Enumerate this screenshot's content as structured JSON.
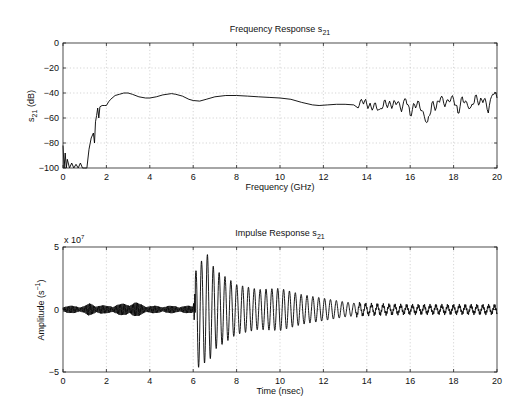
{
  "chart_data": [
    {
      "type": "line",
      "title": "Frequency Response s",
      "title_subscript": "21",
      "xlabel": "Frequency (GHz)",
      "ylabel": "s",
      "ylabel_subscript": "21",
      "ylabel_suffix": " (dB)",
      "xlim": [
        0,
        20
      ],
      "ylim": [
        -100,
        0
      ],
      "xticks": [
        0,
        2,
        4,
        6,
        8,
        10,
        12,
        14,
        16,
        18,
        20
      ],
      "xtick_labels": [
        "0",
        "2",
        "4",
        "6",
        "8",
        "10",
        "12",
        "14",
        "16",
        "18",
        "20"
      ],
      "yticks": [
        0,
        -20,
        -40,
        -60,
        -80,
        -100
      ],
      "ytick_labels": [
        "0",
        "−20",
        "−40",
        "−60",
        "−80",
        "−100"
      ],
      "grid": true,
      "series": [
        {
          "name": "s21 magnitude",
          "x": [
            0,
            0.05,
            0.1,
            0.15,
            0.2,
            0.3,
            0.4,
            0.5,
            0.6,
            0.7,
            0.8,
            0.9,
            1.0,
            1.1,
            1.15,
            1.2,
            1.3,
            1.4,
            1.45,
            1.5,
            1.55,
            1.6,
            1.65,
            1.7,
            1.8,
            1.9,
            2.0,
            2.1,
            2.2,
            2.4,
            2.6,
            2.8,
            3.0,
            3.2,
            3.5,
            3.8,
            4.0,
            4.3,
            4.6,
            5.0,
            5.2,
            5.5,
            5.8,
            6.0,
            6.3,
            6.6,
            7.0,
            7.5,
            8.0,
            8.5,
            9.0,
            9.5,
            10.0,
            10.5,
            11.0,
            11.5,
            11.8,
            12.2,
            12.6,
            13.0,
            13.4,
            13.6,
            13.8,
            14.0,
            14.2,
            14.4,
            14.6,
            14.8,
            15.0,
            15.2,
            15.4,
            15.6,
            15.8,
            16.0,
            16.2,
            16.4,
            16.6,
            16.8,
            17.0,
            17.2,
            17.4,
            17.6,
            17.8,
            18.0,
            18.2,
            18.4,
            18.6,
            18.8,
            19.0,
            19.2,
            19.4,
            19.6,
            19.8,
            20.0
          ],
          "y": [
            -82,
            -100,
            -88,
            -100,
            -93,
            -100,
            -96,
            -100,
            -97,
            -100,
            -96,
            -100,
            -100,
            -100,
            -92,
            -85,
            -76,
            -72,
            -80,
            -63,
            -58,
            -52,
            -60,
            -51,
            -50,
            -50,
            -50,
            -47,
            -45,
            -42,
            -41,
            -40,
            -40,
            -41,
            -43,
            -44,
            -44,
            -43,
            -41.5,
            -40.5,
            -41,
            -42.5,
            -45,
            -46,
            -46.5,
            -45,
            -43,
            -42,
            -42,
            -42.5,
            -43,
            -43.5,
            -44,
            -45,
            -47.5,
            -49.5,
            -50,
            -49.5,
            -49,
            -49,
            -49.5,
            -52,
            -47,
            -49,
            -51,
            -48,
            -53,
            -46,
            -49,
            -50,
            -48,
            -55,
            -45,
            -58,
            -49,
            -47,
            -55,
            -63,
            -48,
            -52,
            -44,
            -51,
            -47,
            -45,
            -56,
            -43,
            -47,
            -51,
            -42,
            -48,
            -45,
            -56,
            -41,
            -44
          ]
        }
      ]
    },
    {
      "type": "line",
      "title": "Impulse Response s",
      "title_subscript": "21",
      "xlabel": "Time (nsec)",
      "ylabel": "Amplitude (s",
      "ylabel_superscript": "−1",
      "ylabel_suffix": ")",
      "y_multiplier_label": "x 10",
      "y_multiplier_exponent": "7",
      "xlim": [
        0,
        20
      ],
      "ylim": [
        -5,
        5
      ],
      "xticks": [
        0,
        2,
        4,
        6,
        8,
        10,
        12,
        14,
        16,
        18,
        20
      ],
      "xtick_labels": [
        "0",
        "2",
        "4",
        "6",
        "8",
        "10",
        "12",
        "14",
        "16",
        "18",
        "20"
      ],
      "yticks": [
        5,
        0,
        -5
      ],
      "ytick_labels": [
        "5",
        "0",
        "−5"
      ],
      "grid": true,
      "series": [
        {
          "name": "impulse response",
          "description": "noise floor ~±0.3 until 6.1 ns, burst peaking ~+4.9 / -4.6 near 6.2-6.6 ns, decaying oscillation (~0.27 ns period) to ~±0.3 by 14 ns",
          "envelope_x": [
            0,
            1,
            1.2,
            2,
            3.3,
            3.5,
            4,
            5,
            6.0,
            6.2,
            6.4,
            6.6,
            7.0,
            8.0,
            9.0,
            10.0,
            11.0,
            12.0,
            13.0,
            14.0,
            16.0,
            18.0,
            20.0
          ],
          "envelope_y": [
            0.3,
            0.3,
            0.5,
            0.3,
            0.6,
            0.5,
            0.3,
            0.3,
            0.3,
            4.9,
            3.8,
            4.6,
            3.2,
            2.0,
            1.6,
            1.7,
            1.2,
            0.9,
            0.6,
            0.4,
            0.3,
            0.3,
            0.3
          ],
          "period": 0.27
        }
      ]
    }
  ]
}
